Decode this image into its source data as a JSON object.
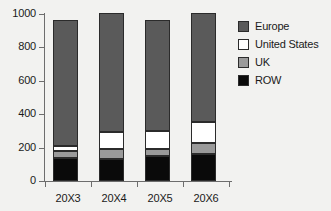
{
  "chart_data": {
    "type": "bar",
    "subtype": "stacked-bar",
    "title": "",
    "subtitle": "",
    "xlabel": "",
    "ylabel": "",
    "categories": [
      "20X3",
      "20X4",
      "20X5",
      "20X6"
    ],
    "series": [
      {
        "name": "ROW",
        "color": "#0a0a0a",
        "values": [
          138,
          130,
          150,
          162
        ]
      },
      {
        "name": "UK",
        "color": "#9a9a9a",
        "values": [
          42,
          60,
          40,
          66
        ]
      },
      {
        "name": "United States",
        "color": "#ffffff",
        "values": [
          30,
          105,
          110,
          127
        ]
      },
      {
        "name": "Europe",
        "color": "#5a5a5a",
        "values": [
          755,
          710,
          665,
          650
        ]
      }
    ],
    "totals": [
      965,
      1005,
      965,
      1005
    ],
    "ylim": [
      0,
      1000
    ],
    "yticks": [
      0,
      200,
      400,
      600,
      800,
      1000
    ],
    "ytick_labels": [
      "0",
      "200",
      "400",
      "600",
      "800",
      "1000"
    ],
    "grid": false,
    "legend_position": "right",
    "legend_order": [
      "Europe",
      "United States",
      "UK",
      "ROW"
    ]
  },
  "legend": {
    "items": [
      {
        "label": "Europe",
        "swatch": "#5a5a5a"
      },
      {
        "label": "United States",
        "swatch": "#ffffff"
      },
      {
        "label": "UK",
        "swatch": "#9a9a9a"
      },
      {
        "label": "ROW",
        "swatch": "#0a0a0a"
      }
    ]
  },
  "axes": {
    "y_labels": [
      "1000",
      "800",
      "600",
      "400",
      "200",
      "0"
    ],
    "x_labels": [
      "20X3",
      "20X4",
      "20X5",
      "20X6"
    ]
  }
}
